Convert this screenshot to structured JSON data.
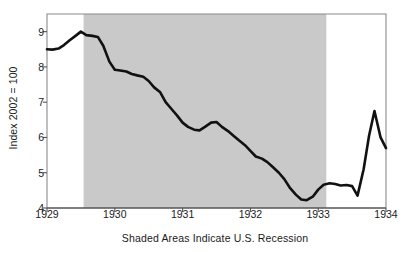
{
  "chart_data": {
    "type": "line",
    "title": "",
    "subtitle": "",
    "xlabel": "Shaded Areas Indicate U.S. Recession",
    "ylabel": "Index 2002 = 100",
    "xlim": [
      1929.0,
      1934.0
    ],
    "ylim": [
      4,
      9.5
    ],
    "x_ticks": [
      1929,
      1930,
      1931,
      1932,
      1933,
      1934
    ],
    "x_tick_labels": [
      "1929",
      "1930",
      "1931",
      "1932",
      "1933",
      "1934"
    ],
    "y_ticks": [
      4,
      5,
      6,
      7,
      8,
      9
    ],
    "y_tick_labels": [
      "4",
      "5",
      "6",
      "7",
      "8",
      "9"
    ],
    "grid": false,
    "legend": "none",
    "line_color": "#111111",
    "line_width": 2.6,
    "shaded_color": "#c9c9c9",
    "frame_color": "#8a8a8a",
    "background": "#ffffff",
    "shaded_regions": [
      {
        "label": "U.S. Recession",
        "start": 1929.54,
        "end": 1933.12
      }
    ],
    "series": [
      {
        "name": "Index 2002 = 100",
        "x": [
          1929.0,
          1929.08,
          1929.17,
          1929.25,
          1929.33,
          1929.42,
          1929.5,
          1929.58,
          1929.67,
          1929.75,
          1929.83,
          1929.92,
          1930.0,
          1930.08,
          1930.17,
          1930.25,
          1930.33,
          1930.42,
          1930.5,
          1930.58,
          1930.67,
          1930.75,
          1930.83,
          1930.92,
          1931.0,
          1931.08,
          1931.17,
          1931.25,
          1931.33,
          1931.42,
          1931.5,
          1931.58,
          1931.67,
          1931.75,
          1931.83,
          1931.92,
          1932.0,
          1932.08,
          1932.17,
          1932.25,
          1932.33,
          1932.42,
          1932.5,
          1932.58,
          1932.67,
          1932.75,
          1932.83,
          1932.92,
          1933.0,
          1933.08,
          1933.17,
          1933.25,
          1933.33,
          1933.42,
          1933.5,
          1933.58,
          1933.67,
          1933.75,
          1933.83,
          1933.92,
          1934.0
        ],
        "y": [
          8.5,
          8.49,
          8.52,
          8.62,
          8.75,
          8.88,
          9.0,
          8.9,
          8.88,
          8.85,
          8.6,
          8.15,
          7.92,
          7.9,
          7.87,
          7.8,
          7.76,
          7.72,
          7.6,
          7.42,
          7.28,
          7.0,
          6.82,
          6.62,
          6.42,
          6.3,
          6.22,
          6.2,
          6.3,
          6.42,
          6.44,
          6.3,
          6.18,
          6.05,
          5.92,
          5.78,
          5.62,
          5.46,
          5.4,
          5.3,
          5.16,
          5.0,
          4.82,
          4.58,
          4.38,
          4.24,
          4.22,
          4.32,
          4.52,
          4.66,
          4.7,
          4.68,
          4.64,
          4.65,
          4.62,
          4.35,
          5.1,
          6.05,
          6.75,
          6.0,
          5.7
        ],
        "annotations": [
          {
            "text": "peak",
            "x": 1929.5,
            "y": 9.0
          },
          {
            "text": "trough",
            "x": 1932.83,
            "y": 4.22
          },
          {
            "text": "post-recession peak",
            "x": 1933.83,
            "y": 6.75
          }
        ]
      }
    ]
  }
}
